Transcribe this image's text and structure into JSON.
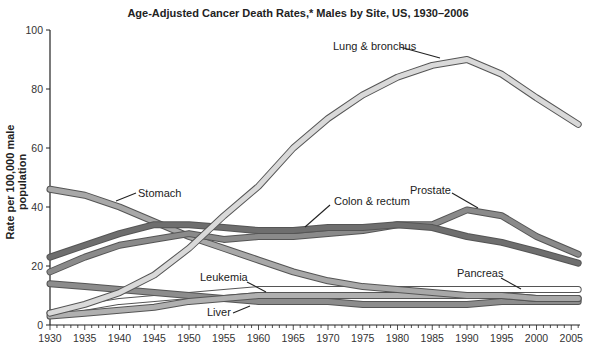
{
  "chart_data": {
    "type": "line",
    "title": "Age-Adjusted Cancer Death Rates,* Males by Site, US, 1930–2006",
    "xlabel": "",
    "ylabel": "Rate per 100,000 male population",
    "xlim": [
      1930,
      2006
    ],
    "ylim": [
      0,
      100
    ],
    "y_ticks": [
      0,
      20,
      40,
      60,
      80,
      100
    ],
    "x_ticks": [
      1930,
      1935,
      1940,
      1945,
      1950,
      1955,
      1960,
      1965,
      1970,
      1975,
      1980,
      1985,
      1990,
      1995,
      2000,
      2005
    ],
    "grid": false,
    "legend": "inline annotations",
    "x": [
      1930,
      1935,
      1940,
      1945,
      1950,
      1955,
      1960,
      1965,
      1970,
      1975,
      1980,
      1985,
      1990,
      1995,
      2000,
      2006
    ],
    "series": [
      {
        "name": "Lung & bronchus",
        "color": "#d9d9d9",
        "values": [
          4,
          7,
          11,
          17,
          26,
          37,
          47,
          60,
          70,
          78,
          84,
          88,
          90,
          85,
          77,
          68
        ]
      },
      {
        "name": "Stomach",
        "color": "#a8a8a8",
        "values": [
          46,
          44,
          40,
          35,
          30,
          26,
          22,
          18,
          15,
          13,
          12,
          11,
          10,
          10,
          9,
          9
        ]
      },
      {
        "name": "Colon & rectum",
        "color": "#6e6e6e",
        "values": [
          23,
          27,
          31,
          34,
          34,
          33,
          32,
          32,
          33,
          33,
          34,
          33,
          30,
          28,
          25,
          21
        ]
      },
      {
        "name": "Prostate",
        "color": "#8a8a8a",
        "values": [
          18,
          23,
          27,
          29,
          31,
          29,
          30,
          30,
          31,
          32,
          34,
          34,
          39,
          37,
          30,
          24
        ]
      },
      {
        "name": "Pancreas",
        "color": "#ffffff",
        "values": [
          4,
          6,
          8,
          9,
          10,
          11,
          12,
          12,
          12,
          12,
          12,
          12,
          12,
          12,
          12,
          12
        ]
      },
      {
        "name": "Leukemia",
        "color": "#b0b0b0",
        "values": [
          3,
          4,
          5,
          6,
          8,
          9,
          10,
          10,
          10,
          10,
          10,
          10,
          10,
          10,
          9,
          9
        ]
      },
      {
        "name": "Liver",
        "color": "#8c8c8c",
        "values": [
          14,
          13,
          12,
          11,
          10,
          9,
          8,
          8,
          8,
          7,
          7,
          7,
          7,
          8,
          8,
          8
        ]
      }
    ],
    "annotations": [
      {
        "label": "Lung & bronchus",
        "series": "Lung & bronchus"
      },
      {
        "label": "Stomach",
        "series": "Stomach"
      },
      {
        "label": "Colon & rectum",
        "series": "Colon & rectum"
      },
      {
        "label": "Prostate",
        "series": "Prostate"
      },
      {
        "label": "Pancreas",
        "series": "Pancreas"
      },
      {
        "label": "Leukemia",
        "series": "Leukemia"
      },
      {
        "label": "Liver",
        "series": "Liver"
      }
    ]
  }
}
